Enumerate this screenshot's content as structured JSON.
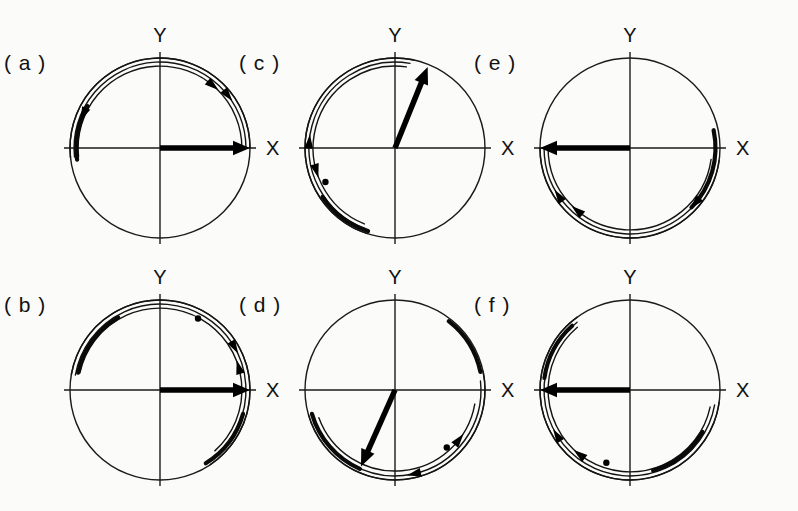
{
  "figure": {
    "background_color": "#fbfbfa",
    "ink_color": "#111111",
    "width": 798,
    "height": 511,
    "panel_count": 6,
    "axis_labels": {
      "x": "X",
      "y": "Y"
    }
  },
  "chart_data": {
    "type": "scatter",
    "xlabel": "X",
    "ylabel": "Y",
    "grid": false,
    "legend_position": "none",
    "layout": {
      "rows": 2,
      "cols": 3,
      "order": [
        "a",
        "b",
        "c",
        "d",
        "e",
        "f"
      ]
    },
    "panels": [
      {
        "id": "a",
        "label": "( a )",
        "center": [
          160,
          148
        ],
        "radius": 90,
        "x_label": "X",
        "y_label": "Y",
        "vector": {
          "angle_deg": 0,
          "length_fraction": 1.0,
          "label": "major-axis vector"
        },
        "arcs": [
          {
            "radius_fraction": 1.0,
            "start_deg": 0,
            "end_deg": 186,
            "weight": "thin",
            "arrowheads": []
          },
          {
            "radius_fraction": 0.955,
            "start_deg": 0,
            "end_deg": 186,
            "weight": "thin",
            "arrowheads": [
              {
                "at_deg": 38,
                "direction": "clockwise"
              }
            ]
          },
          {
            "radius_fraction": 0.91,
            "start_deg": 0,
            "end_deg": 186,
            "weight": "thin",
            "arrowheads": [
              {
                "at_deg": 50,
                "direction": "clockwise"
              }
            ]
          },
          {
            "radius_fraction": 0.93,
            "start_deg": 150,
            "end_deg": 188,
            "weight": "thick",
            "arrowheads": [
              {
                "at_deg": 156,
                "direction": "counterclockwise"
              }
            ]
          }
        ],
        "dots": []
      },
      {
        "id": "b",
        "label": "( b )",
        "center": [
          160,
          390
        ],
        "radius": 90,
        "x_label": "X",
        "y_label": "Y",
        "vector": {
          "angle_deg": 0,
          "length_fraction": 1.0,
          "label": "major-axis vector"
        },
        "arcs": [
          {
            "radius_fraction": 1.0,
            "start_deg": -56,
            "end_deg": 170,
            "weight": "thin",
            "arrowheads": []
          },
          {
            "radius_fraction": 0.955,
            "start_deg": -52,
            "end_deg": 170,
            "weight": "thin",
            "arrowheads": [
              {
                "at_deg": 30,
                "direction": "clockwise"
              }
            ]
          },
          {
            "radius_fraction": 0.91,
            "start_deg": -48,
            "end_deg": 168,
            "weight": "thin",
            "arrowheads": [
              {
                "at_deg": 16,
                "direction": "counterclockwise"
              }
            ]
          },
          {
            "radius_fraction": 0.93,
            "start_deg": 120,
            "end_deg": 168,
            "weight": "thick",
            "arrowheads": []
          },
          {
            "radius_fraction": 0.96,
            "start_deg": -58,
            "end_deg": -16,
            "weight": "thick",
            "arrowheads": []
          }
        ],
        "dots": [
          {
            "angle_deg": 62,
            "radius_fraction": 0.9
          }
        ]
      },
      {
        "id": "c",
        "label": "( c )",
        "center": [
          395,
          148
        ],
        "radius": 90,
        "x_label": "X",
        "y_label": "Y",
        "vector": {
          "angle_deg": 68,
          "length_fraction": 0.97,
          "label": "major-axis vector"
        },
        "arcs": [
          {
            "radius_fraction": 1.0,
            "start_deg": 78,
            "end_deg": 252,
            "weight": "thin",
            "arrowheads": []
          },
          {
            "radius_fraction": 0.955,
            "start_deg": 80,
            "end_deg": 250,
            "weight": "thin",
            "arrowheads": [
              {
                "at_deg": 176,
                "direction": "clockwise"
              }
            ]
          },
          {
            "radius_fraction": 0.91,
            "start_deg": 82,
            "end_deg": 248,
            "weight": "thin",
            "arrowheads": [
              {
                "at_deg": 196,
                "direction": "counterclockwise"
              }
            ]
          },
          {
            "radius_fraction": 0.97,
            "start_deg": 214,
            "end_deg": 252,
            "weight": "thick",
            "arrowheads": []
          }
        ],
        "dots": [
          {
            "angle_deg": 206,
            "radius_fraction": 0.86
          }
        ]
      },
      {
        "id": "d",
        "label": "( d )",
        "center": [
          395,
          390
        ],
        "radius": 90,
        "x_label": "X",
        "y_label": "Y",
        "vector": {
          "angle_deg": 246,
          "length_fraction": 0.93,
          "label": "major-axis vector"
        },
        "arcs": [
          {
            "radius_fraction": 1.0,
            "start_deg": 196,
            "end_deg": 372,
            "weight": "thin",
            "arrowheads": []
          },
          {
            "radius_fraction": 0.955,
            "start_deg": 198,
            "end_deg": 366,
            "weight": "thin",
            "arrowheads": [
              {
                "at_deg": 283,
                "direction": "clockwise"
              }
            ]
          },
          {
            "radius_fraction": 0.9,
            "start_deg": 200,
            "end_deg": 350,
            "weight": "thin",
            "arrowheads": [
              {
                "at_deg": 322,
                "direction": "counterclockwise"
              }
            ]
          },
          {
            "radius_fraction": 0.96,
            "start_deg": 196,
            "end_deg": 246,
            "weight": "thick",
            "arrowheads": []
          },
          {
            "radius_fraction": 0.97,
            "start_deg": 12,
            "end_deg": 52,
            "weight": "thick",
            "arrowheads": []
          }
        ],
        "dots": [
          {
            "angle_deg": 312,
            "radius_fraction": 0.86
          }
        ]
      },
      {
        "id": "e",
        "label": "( e )",
        "center": [
          630,
          148
        ],
        "radius": 90,
        "x_label": "X",
        "y_label": "Y",
        "vector": {
          "angle_deg": 180,
          "length_fraction": 1.0,
          "label": "major-axis vector"
        },
        "arcs": [
          {
            "radius_fraction": 1.0,
            "start_deg": 180,
            "end_deg": 352,
            "weight": "thin",
            "arrowheads": []
          },
          {
            "radius_fraction": 0.955,
            "start_deg": 180,
            "end_deg": 352,
            "weight": "thin",
            "arrowheads": [
              {
                "at_deg": 214,
                "direction": "clockwise"
              }
            ]
          },
          {
            "radius_fraction": 0.91,
            "start_deg": 180,
            "end_deg": 352,
            "weight": "thin",
            "arrowheads": [
              {
                "at_deg": 230,
                "direction": "clockwise"
              }
            ]
          },
          {
            "radius_fraction": 0.95,
            "start_deg": -44,
            "end_deg": 12,
            "weight": "thick",
            "arrowheads": [
              {
                "at_deg": -40,
                "direction": "clockwise"
              }
            ]
          }
        ],
        "dots": []
      },
      {
        "id": "f",
        "label": "( f )",
        "center": [
          630,
          390
        ],
        "radius": 90,
        "x_label": "X",
        "y_label": "Y",
        "vector": {
          "angle_deg": 180,
          "length_fraction": 1.0,
          "label": "major-axis vector"
        },
        "arcs": [
          {
            "radius_fraction": 1.0,
            "start_deg": 126,
            "end_deg": 352,
            "weight": "thin",
            "arrowheads": []
          },
          {
            "radius_fraction": 0.955,
            "start_deg": 128,
            "end_deg": 350,
            "weight": "thin",
            "arrowheads": [
              {
                "at_deg": 212,
                "direction": "clockwise"
              }
            ]
          },
          {
            "radius_fraction": 0.91,
            "start_deg": 130,
            "end_deg": 348,
            "weight": "thin",
            "arrowheads": [
              {
                "at_deg": 232,
                "direction": "clockwise"
              }
            ]
          },
          {
            "radius_fraction": 0.96,
            "start_deg": 132,
            "end_deg": 172,
            "weight": "thick",
            "arrowheads": []
          },
          {
            "radius_fraction": 0.93,
            "start_deg": 286,
            "end_deg": 330,
            "weight": "thick",
            "arrowheads": []
          }
        ],
        "dots": [
          {
            "angle_deg": 252,
            "radius_fraction": 0.85
          }
        ]
      }
    ]
  }
}
